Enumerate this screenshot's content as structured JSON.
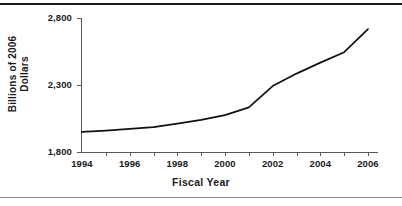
{
  "figure": {
    "background_color": "#ffffff",
    "rule_color_top": "#1a1a1a",
    "rule_color_bottom": "#8c8c8c",
    "line_color": "#111111",
    "axis_color": "#5a5a5a"
  },
  "chart_data": {
    "type": "line",
    "title": "",
    "xlabel": "Fiscal Year",
    "ylabel": "Billions of 2006 Dollars",
    "ylabel_line1": "Billions of 2006",
    "ylabel_line2": "Dollars",
    "x": [
      1994,
      1995,
      1996,
      1997,
      1998,
      1999,
      2000,
      2001,
      2002,
      2003,
      2004,
      2005,
      2006
    ],
    "values": [
      1950,
      1960,
      1972,
      1985,
      2012,
      2040,
      2075,
      2133,
      2292,
      2385,
      2467,
      2545,
      2717
    ],
    "series": [
      {
        "name": "Billions of 2006 Dollars",
        "values": [
          1950,
          1960,
          1972,
          1985,
          2012,
          2040,
          2075,
          2133,
          2292,
          2385,
          2467,
          2545,
          2717
        ]
      }
    ],
    "xlim": [
      1994,
      2006
    ],
    "ylim": [
      1800,
      2800
    ],
    "ytick_values": [
      1800,
      2300,
      2800
    ],
    "ytick_labels": [
      "1,800",
      "2,300",
      "2,800"
    ],
    "xtick_values": [
      1994,
      1995,
      1996,
      1997,
      1998,
      1999,
      2000,
      2001,
      2002,
      2003,
      2004,
      2005,
      2006
    ],
    "xtick_labels_shown": [
      "1994",
      "1996",
      "1998",
      "2000",
      "2002",
      "2004",
      "2006"
    ],
    "xtick_labeled_values": [
      1994,
      1996,
      1998,
      2000,
      2002,
      2004,
      2006
    ],
    "grid": false,
    "legend": false,
    "legend_position": "none"
  }
}
